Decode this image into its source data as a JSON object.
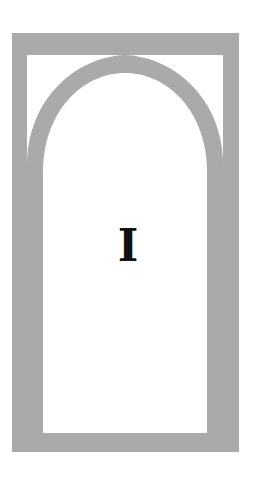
{
  "ornament": {
    "letter": "I",
    "frame_color": "#aaaaaa",
    "background_color": "#ffffff",
    "letter_color": "#111111"
  }
}
